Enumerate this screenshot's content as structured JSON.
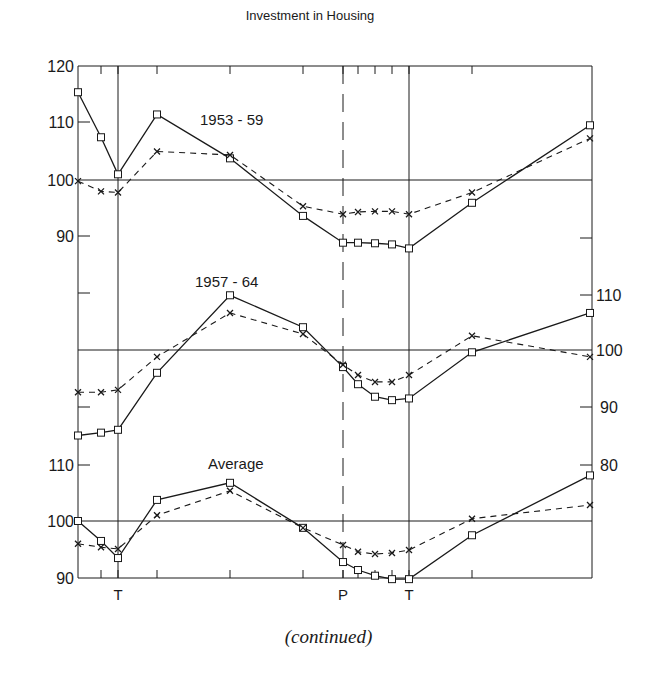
{
  "title": "Investment in Housing",
  "caption": "(continued)",
  "x_markers": {
    "turning_left": "T",
    "peak": "P",
    "turning_right": "T"
  },
  "panel_labels": {
    "top": "1953 - 59",
    "middle": "1957 - 64",
    "bottom": "Average"
  },
  "left_axis_top": {
    "ticks": [
      "120",
      "110",
      "100",
      "90"
    ]
  },
  "left_axis_bottom": {
    "ticks": [
      "110",
      "100",
      "90"
    ]
  },
  "right_axis_middle": {
    "ticks": [
      "110",
      "100",
      "90",
      "80"
    ]
  },
  "legend": {
    "solid_series": "solid line, square markers",
    "dashed_series": "dashed line, x markers"
  },
  "chart_data": [
    {
      "type": "line",
      "title": "Investment in Housing — 1953 - 59",
      "xlabel": "",
      "ylabel": "",
      "x": [
        1,
        2,
        3,
        4,
        5,
        6,
        7,
        8,
        9,
        10,
        11,
        12,
        13
      ],
      "markers": {
        "T": 3,
        "P": 7,
        "T2": 11
      },
      "ylim": [
        80,
        120
      ],
      "axis": "left",
      "series": [
        {
          "name": "solid (squares)",
          "style": "solid",
          "values": [
            115.4,
            107.5,
            101.0,
            111.5,
            103.8,
            93.7,
            89.0,
            89.0,
            88.9,
            88.7,
            88.0,
            96.0,
            109.6
          ]
        },
        {
          "name": "dashed (x)",
          "style": "dashed",
          "values": [
            99.8,
            98.0,
            97.8,
            105.0,
            104.4,
            95.4,
            94.0,
            94.4,
            94.5,
            94.5,
            94.0,
            97.8,
            107.3
          ]
        }
      ],
      "grid": false,
      "reference_line": 100
    },
    {
      "type": "line",
      "title": "Investment in Housing — 1957 - 64",
      "xlabel": "",
      "ylabel": "",
      "x": [
        1,
        2,
        3,
        4,
        5,
        6,
        7,
        8,
        9,
        10,
        11,
        12,
        13
      ],
      "markers": {
        "T": 3,
        "P": 7,
        "T2": 11
      },
      "ylim": [
        80,
        115
      ],
      "axis": "right",
      "series": [
        {
          "name": "solid (squares)",
          "style": "solid",
          "values": [
            85.0,
            85.5,
            86.0,
            96.0,
            109.6,
            104.0,
            97.0,
            94.0,
            91.8,
            91.2,
            91.5,
            99.6,
            106.5
          ]
        },
        {
          "name": "dashed (x)",
          "style": "dashed",
          "values": [
            92.6,
            92.6,
            93.0,
            98.8,
            106.5,
            102.8,
            97.4,
            95.6,
            94.4,
            94.4,
            95.6,
            102.5,
            98.8
          ]
        }
      ],
      "grid": false,
      "reference_line": 100
    },
    {
      "type": "line",
      "title": "Investment in Housing — Average",
      "xlabel": "",
      "ylabel": "",
      "x": [
        1,
        2,
        3,
        4,
        5,
        6,
        7,
        8,
        9,
        10,
        11,
        12,
        13
      ],
      "markers": {
        "T": 3,
        "P": 7,
        "T2": 11
      },
      "ylim": [
        90,
        112
      ],
      "axis": "left",
      "series": [
        {
          "name": "solid (squares)",
          "style": "solid",
          "values": [
            100.0,
            96.5,
            93.5,
            103.7,
            106.7,
            98.8,
            92.8,
            91.4,
            90.4,
            89.8,
            89.8,
            97.5,
            108.0
          ]
        },
        {
          "name": "dashed (x)",
          "style": "dashed",
          "values": [
            96.0,
            95.4,
            95.1,
            101.0,
            105.3,
            98.8,
            95.8,
            94.6,
            94.2,
            94.4,
            94.9,
            100.4,
            102.8
          ]
        }
      ],
      "grid": false,
      "reference_line": 100
    }
  ]
}
